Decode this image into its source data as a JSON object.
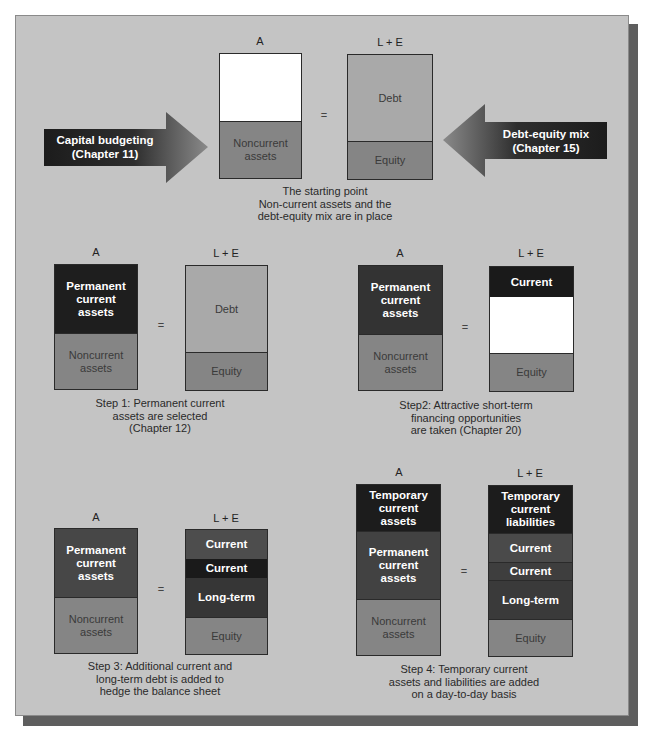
{
  "colors": {
    "panel_bg": "#c4c4c4",
    "shadow": "#5e5e5e",
    "light_gray": "#a9a9a9",
    "mid_gray": "#858585",
    "dark": "#1e1e1e",
    "dark_mid": "#454545",
    "white": "#ffffff"
  },
  "labels": {
    "assets_header": "A",
    "liab_equity_header": "L + E",
    "equals": "="
  },
  "arrows": {
    "left": {
      "line1": "Capital budgeting",
      "line2": "(Chapter 11)"
    },
    "right": {
      "line1": "Debt-equity mix",
      "line2": "(Chapter 15)"
    }
  },
  "panels": {
    "start": {
      "assets": [
        {
          "label": "",
          "color": "#ffffff"
        },
        {
          "label": "Noncurrent assets",
          "color": "#858585"
        }
      ],
      "liabilities": [
        {
          "label": "Debt",
          "color": "#a9a9a9"
        },
        {
          "label": "Equity",
          "color": "#858585"
        }
      ],
      "caption": [
        "The starting point",
        "Non-current assets and the",
        "debt-equity mix are in place"
      ]
    },
    "step1": {
      "assets": [
        {
          "label": "Permanent current assets",
          "color": "#1e1e1e"
        },
        {
          "label": "Noncurrent assets",
          "color": "#858585"
        }
      ],
      "liabilities": [
        {
          "label": "Debt",
          "color": "#a9a9a9"
        },
        {
          "label": "Equity",
          "color": "#858585"
        }
      ],
      "caption": [
        "Step 1: Permanent current",
        "assets are selected",
        "(Chapter 12)"
      ]
    },
    "step2": {
      "assets": [
        {
          "label": "Permanent current assets",
          "color": "#333333"
        },
        {
          "label": "Noncurrent assets",
          "color": "#858585"
        }
      ],
      "liabilities": [
        {
          "label": "Current",
          "color": "#1a1a1a"
        },
        {
          "label": "",
          "color": "#ffffff"
        },
        {
          "label": "Equity",
          "color": "#858585"
        }
      ],
      "caption": [
        "Step2: Attractive short-term",
        "financing opportunities",
        "are taken (Chapter 20)"
      ]
    },
    "step3": {
      "assets": [
        {
          "label": "Permanent current assets",
          "color": "#474747"
        },
        {
          "label": "Noncurrent assets",
          "color": "#858585"
        }
      ],
      "liabilities": [
        {
          "label": "Current",
          "color": "#4d4d4d"
        },
        {
          "label": "Current",
          "color": "#1a1a1a"
        },
        {
          "label": "Long-term",
          "color": "#363636"
        },
        {
          "label": "Equity",
          "color": "#858585"
        }
      ],
      "caption": [
        "Step 3: Additional current and",
        "long-term debt is added to",
        "hedge the balance sheet"
      ]
    },
    "step4": {
      "assets": [
        {
          "label": "Temporary current assets",
          "color": "#1c1c1c"
        },
        {
          "label": "Permanent current assets",
          "color": "#424242"
        },
        {
          "label": "Noncurrent assets",
          "color": "#858585"
        }
      ],
      "liabilities": [
        {
          "label": "Temporary current liabilities",
          "color": "#1c1c1c"
        },
        {
          "label": "Current",
          "color": "#4a4a4a"
        },
        {
          "label": "Current",
          "color": "#3e3e3e"
        },
        {
          "label": "Long-term",
          "color": "#3a3a3a"
        },
        {
          "label": "Equity",
          "color": "#858585"
        }
      ],
      "caption": [
        "Step 4: Temporary current",
        "assets and liabilities are added",
        "on a day-to-day basis"
      ]
    }
  }
}
